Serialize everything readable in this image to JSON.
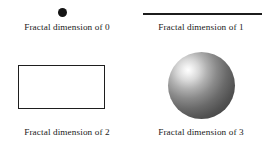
{
  "figure": {
    "background_color": "#ffffff",
    "text_color": "#1a1a1a"
  },
  "panels": [
    {
      "id": "dimension-0",
      "shape": "dot",
      "shape_icon": "filled-circle-icon",
      "caption": "Fractal dimension of 0",
      "dimension_value": "0",
      "color": "#141414"
    },
    {
      "id": "dimension-1",
      "shape": "line",
      "shape_icon": "horizontal-line-icon",
      "caption": "Fractal dimension of 1",
      "dimension_value": "1",
      "color": "#1c1c1c"
    },
    {
      "id": "dimension-2",
      "shape": "rectangle",
      "shape_icon": "rectangle-outline-icon",
      "caption": "Fractal dimension of 2",
      "dimension_value": "2",
      "color": "#1e1e1e"
    },
    {
      "id": "dimension-3",
      "shape": "sphere",
      "shape_icon": "shaded-sphere-icon",
      "caption": "Fractal dimension of 3",
      "dimension_value": "3",
      "color": "#3d3d3d",
      "highlight_color": "#ffffff"
    }
  ]
}
